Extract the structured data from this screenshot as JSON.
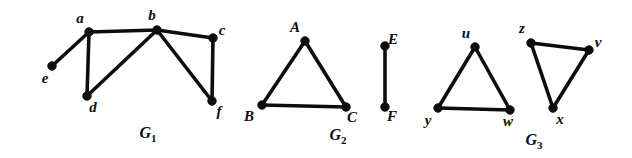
{
  "figure": {
    "background_color": "#ffffff",
    "ink_color": "#0d0d0d",
    "width": 632,
    "height": 158
  },
  "graphs": [
    {
      "id": "G1",
      "caption_base": "G",
      "caption_sub": "1",
      "caption_x": 148,
      "caption_y": 138,
      "vertices": [
        {
          "name": "a",
          "x": 89,
          "y": 32,
          "label": "a",
          "label_x": 80,
          "label_y": 23
        },
        {
          "name": "b",
          "x": 157,
          "y": 30,
          "label": "b",
          "label_x": 152,
          "label_y": 20
        },
        {
          "name": "c",
          "x": 213,
          "y": 38,
          "label": "c",
          "label_x": 222,
          "label_y": 35
        },
        {
          "name": "d",
          "x": 87,
          "y": 96,
          "label": "d",
          "label_x": 93,
          "label_y": 112
        },
        {
          "name": "e",
          "x": 52,
          "y": 66,
          "label": "e",
          "label_x": 45,
          "label_y": 83
        },
        {
          "name": "f",
          "x": 212,
          "y": 101,
          "label": "f",
          "label_x": 219,
          "label_y": 116
        }
      ],
      "edges": [
        {
          "from": "a",
          "to": "e"
        },
        {
          "from": "a",
          "to": "b"
        },
        {
          "from": "a",
          "to": "d"
        },
        {
          "from": "b",
          "to": "d"
        },
        {
          "from": "b",
          "to": "c"
        },
        {
          "from": "b",
          "to": "f"
        },
        {
          "from": "c",
          "to": "f"
        }
      ]
    },
    {
      "id": "G2",
      "caption_base": "G",
      "caption_sub": "2",
      "caption_x": 338,
      "caption_y": 140,
      "vertices": [
        {
          "name": "A",
          "x": 305,
          "y": 41,
          "label": "A",
          "label_x": 295,
          "label_y": 32
        },
        {
          "name": "B",
          "x": 262,
          "y": 105,
          "label": "B",
          "label_x": 249,
          "label_y": 121
        },
        {
          "name": "C",
          "x": 346,
          "y": 107,
          "label": "C",
          "label_x": 352,
          "label_y": 122
        },
        {
          "name": "E",
          "x": 385,
          "y": 46,
          "label": "E",
          "label_x": 393,
          "label_y": 44
        },
        {
          "name": "F",
          "x": 385,
          "y": 107,
          "label": "F",
          "label_x": 392,
          "label_y": 121
        }
      ],
      "edges": [
        {
          "from": "A",
          "to": "B"
        },
        {
          "from": "A",
          "to": "C"
        },
        {
          "from": "B",
          "to": "C"
        },
        {
          "from": "E",
          "to": "F"
        }
      ]
    },
    {
      "id": "G3",
      "caption_base": "G",
      "caption_sub": "3",
      "caption_x": 534,
      "caption_y": 145,
      "vertices": [
        {
          "name": "u",
          "x": 475,
          "y": 47,
          "label": "u",
          "label_x": 466,
          "label_y": 38
        },
        {
          "name": "y",
          "x": 438,
          "y": 108,
          "label": "y",
          "label_x": 428,
          "label_y": 125
        },
        {
          "name": "w",
          "x": 510,
          "y": 110,
          "label": "w",
          "label_x": 508,
          "label_y": 126
        },
        {
          "name": "z",
          "x": 531,
          "y": 43,
          "label": "z",
          "label_x": 522,
          "label_y": 33
        },
        {
          "name": "v",
          "x": 589,
          "y": 50,
          "label": "v",
          "label_x": 598,
          "label_y": 47
        },
        {
          "name": "x",
          "x": 553,
          "y": 108,
          "label": "x",
          "label_x": 560,
          "label_y": 124
        }
      ],
      "edges": [
        {
          "from": "u",
          "to": "y"
        },
        {
          "from": "u",
          "to": "w"
        },
        {
          "from": "y",
          "to": "w"
        },
        {
          "from": "z",
          "to": "v"
        },
        {
          "from": "z",
          "to": "x"
        },
        {
          "from": "v",
          "to": "x"
        }
      ]
    }
  ]
}
